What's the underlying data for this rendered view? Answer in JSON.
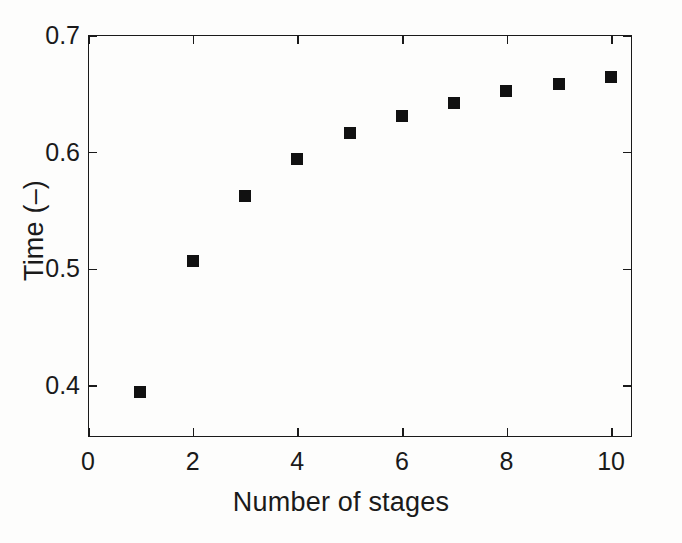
{
  "chart_data": {
    "type": "scatter",
    "title": "",
    "xlabel": "Number of stages",
    "ylabel": "Time (–)",
    "x": [
      1,
      2,
      3,
      4,
      5,
      6,
      7,
      8,
      9,
      10
    ],
    "values": [
      0.394,
      0.506,
      0.562,
      0.594,
      0.616,
      0.631,
      0.642,
      0.652,
      0.658,
      0.664
    ],
    "series": [
      {
        "name": "Time",
        "values": [
          0.394,
          0.506,
          0.562,
          0.594,
          0.616,
          0.631,
          0.642,
          0.652,
          0.658,
          0.664
        ]
      }
    ],
    "xlim": [
      0,
      10.4
    ],
    "ylim": [
      0.3555,
      0.7
    ],
    "xticks": [
      0,
      2,
      4,
      6,
      8,
      10
    ],
    "yticks": [
      0.4,
      0.5,
      0.6,
      0.7
    ],
    "xticklabels": [
      "0",
      "2",
      "4",
      "6",
      "8",
      "10"
    ],
    "yticklabels": [
      "0.4",
      "0.5",
      "0.6",
      "0.7"
    ],
    "grid": false,
    "legend": null,
    "marker": "filled-square",
    "marker_color": "#111111",
    "axes_color": "#1a1a1a",
    "background_color": "#fdfdfc"
  }
}
